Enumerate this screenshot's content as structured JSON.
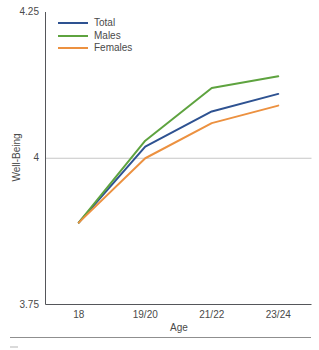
{
  "chart_data": {
    "type": "line",
    "title": "",
    "xlabel": "Age",
    "ylabel": "Well-Being",
    "categories": [
      "18",
      "19/20",
      "21/22",
      "23/24"
    ],
    "series": [
      {
        "name": "Total",
        "color": "#2e5291",
        "values": [
          3.89,
          4.02,
          4.08,
          4.11
        ]
      },
      {
        "name": "Males",
        "color": "#5ea33f",
        "values": [
          3.89,
          4.03,
          4.12,
          4.14
        ]
      },
      {
        "name": "Females",
        "color": "#ec9140",
        "values": [
          3.89,
          4.0,
          4.06,
          4.09
        ]
      }
    ],
    "ylim": [
      3.75,
      4.25
    ],
    "y_ticks": [
      "3.75",
      "4",
      "4.25"
    ],
    "grid": "single horizontal reference line at y=4",
    "legend_position": "top-left inside plot area"
  },
  "colors": {
    "axis_line": "#55565a",
    "reference_gridline": "#c6c6c6",
    "text": "#4a4a4a",
    "bottom_divider": "#8f8f8f"
  }
}
